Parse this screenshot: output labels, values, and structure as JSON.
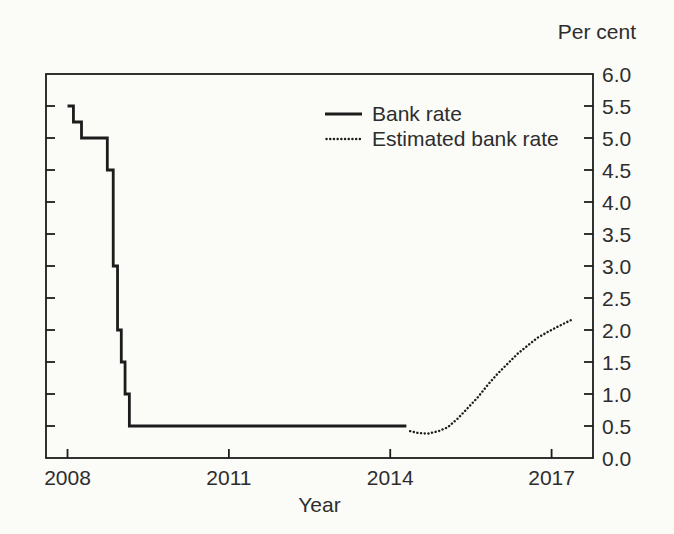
{
  "colors": {
    "line": "#1c1c1c",
    "text": "#2d2d2d",
    "background": "#fbfbf8"
  },
  "chart_data": {
    "type": "line",
    "title": "",
    "xlabel": "Year",
    "ylabel": "Per cent",
    "xlim": [
      2007.6,
      2017.77
    ],
    "ylim": [
      0.0,
      6.0
    ],
    "x_ticks": [
      2008,
      2011,
      2014,
      2017
    ],
    "y_ticks": [
      0.0,
      0.5,
      1.0,
      1.5,
      2.0,
      2.5,
      3.0,
      3.5,
      4.0,
      4.5,
      5.0,
      5.5,
      6.0
    ],
    "grid": false,
    "legend_position": "inside-top-right",
    "series": [
      {
        "name": "Bank rate",
        "type": "step",
        "style": "solid",
        "color": "#1c1c1c",
        "points": [
          [
            2008.0,
            5.5
          ],
          [
            2008.11,
            5.25
          ],
          [
            2008.26,
            5.0
          ],
          [
            2008.74,
            4.5
          ],
          [
            2008.85,
            3.0
          ],
          [
            2008.93,
            2.0
          ],
          [
            2009.0,
            1.5
          ],
          [
            2009.07,
            1.0
          ],
          [
            2009.15,
            0.5
          ],
          [
            2014.3,
            0.5
          ]
        ]
      },
      {
        "name": "Estimated bank rate",
        "type": "curve",
        "style": "dotted",
        "color": "#1c1c1c",
        "points": [
          [
            2014.37,
            0.42
          ],
          [
            2014.52,
            0.39
          ],
          [
            2014.7,
            0.38
          ],
          [
            2014.9,
            0.42
          ],
          [
            2015.07,
            0.48
          ],
          [
            2015.26,
            0.62
          ],
          [
            2015.44,
            0.78
          ],
          [
            2015.63,
            0.95
          ],
          [
            2015.81,
            1.14
          ],
          [
            2016.0,
            1.32
          ],
          [
            2016.19,
            1.48
          ],
          [
            2016.37,
            1.63
          ],
          [
            2016.56,
            1.76
          ],
          [
            2016.74,
            1.88
          ],
          [
            2016.93,
            1.97
          ],
          [
            2017.11,
            2.05
          ],
          [
            2017.3,
            2.13
          ],
          [
            2017.4,
            2.17
          ]
        ]
      }
    ]
  }
}
